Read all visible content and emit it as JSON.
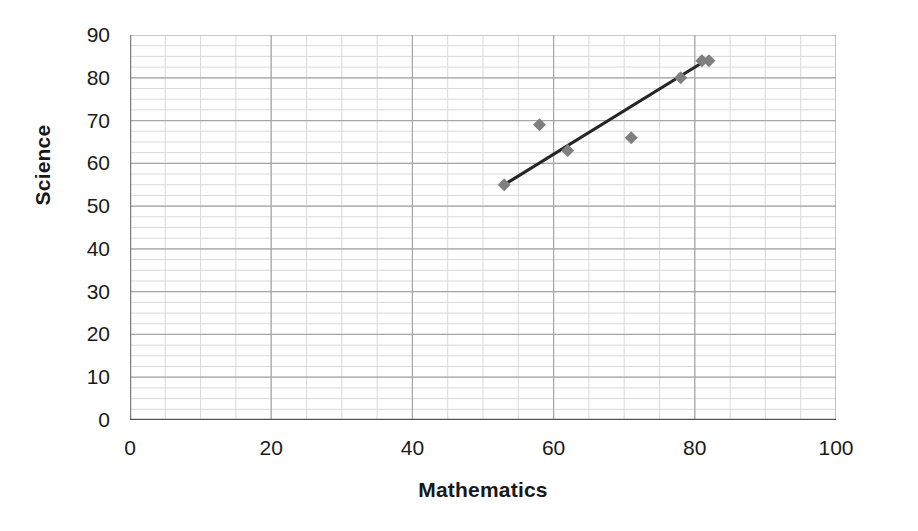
{
  "chart_data": {
    "type": "scatter",
    "title": "",
    "xlabel": "Mathematics",
    "ylabel": "Science",
    "xlim": [
      0,
      100
    ],
    "ylim": [
      0,
      90
    ],
    "x_ticks": [
      0,
      20,
      40,
      60,
      80,
      100
    ],
    "y_ticks": [
      0,
      10,
      20,
      30,
      40,
      50,
      60,
      70,
      80,
      90
    ],
    "x_tick_labels": [
      "0",
      "20",
      "40",
      "60",
      "80",
      "100"
    ],
    "y_tick_labels": [
      "0",
      "10",
      "20",
      "30",
      "40",
      "50",
      "60",
      "70",
      "80",
      "90"
    ],
    "x_major_step": 20,
    "y_major_step": 10,
    "x_minor_step": 5,
    "y_minor_step": 2.5,
    "grid": true,
    "grid_minor": true,
    "legend": false,
    "legend_position": "none",
    "marker": "diamond",
    "marker_color": "#7f7f7f",
    "marker_size": 13,
    "points": [
      {
        "x": 53,
        "y": 55
      },
      {
        "x": 58,
        "y": 69
      },
      {
        "x": 62,
        "y": 63
      },
      {
        "x": 71,
        "y": 66
      },
      {
        "x": 78,
        "y": 80
      },
      {
        "x": 81,
        "y": 84
      },
      {
        "x": 82,
        "y": 84
      }
    ],
    "trendline": {
      "visible": true,
      "type": "linear",
      "color": "#262626",
      "width": 3,
      "x_start": 53,
      "y_start": 55,
      "x_end": 82,
      "y_end": 84.5
    },
    "colors": {
      "marker": "#7f7f7f",
      "trendline": "#262626",
      "major_grid": "#a6a6a6",
      "minor_grid": "#d9d9d9",
      "axis": "#7f7f7f",
      "text": "#1a1a1a",
      "background": "#ffffff"
    }
  }
}
